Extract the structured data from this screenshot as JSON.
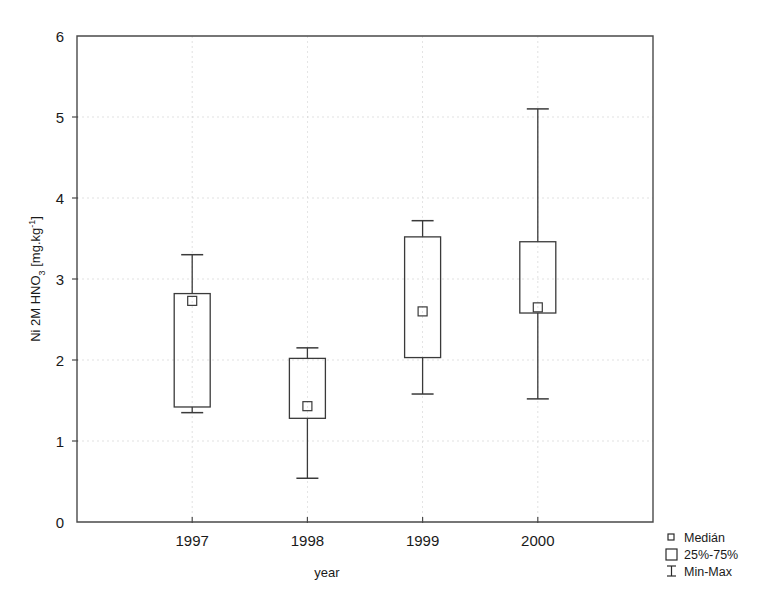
{
  "chart_data": {
    "type": "box",
    "title": "",
    "xlabel": "year",
    "ylabel": "Ni 2M HNO3 [mg.kg-1]",
    "ylabel_parts": {
      "prefix": "Ni 2M HNO",
      "sub": "3",
      "mid": " [mg.kg",
      "sup": "-1",
      "suffix": "]"
    },
    "categories": [
      "1997",
      "1998",
      "1999",
      "2000"
    ],
    "ylim": [
      0,
      6
    ],
    "yticks": [
      0,
      1,
      2,
      3,
      4,
      5,
      6
    ],
    "ytick_labels": [
      "0",
      "1",
      "2",
      "3",
      "4",
      "5",
      "6"
    ],
    "grid": true,
    "grid_style": "dotted",
    "legend_position": "bottom-right",
    "legend": [
      {
        "label": "Medián",
        "glyph": "small-square",
        "meaning": "median"
      },
      {
        "label": "25%-75%",
        "glyph": "large-square",
        "meaning": "interquartile-range"
      },
      {
        "label": "Min-Max",
        "glyph": "i-beam",
        "meaning": "range"
      }
    ],
    "boxes": [
      {
        "category": "1997",
        "min": 1.35,
        "q1": 1.42,
        "median": 2.73,
        "q3": 2.82,
        "max": 3.3
      },
      {
        "category": "1998",
        "min": 0.54,
        "q1": 1.28,
        "median": 1.43,
        "q3": 2.02,
        "max": 2.15
      },
      {
        "category": "1999",
        "min": 1.58,
        "q1": 2.03,
        "median": 2.6,
        "q3": 3.52,
        "max": 3.72
      },
      {
        "category": "2000",
        "min": 1.52,
        "q1": 2.58,
        "median": 2.65,
        "q3": 3.46,
        "max": 5.1
      }
    ],
    "colors": {
      "axis": "#4a4a4a",
      "box": "#3a3a3a",
      "grid": "#c9c9c9",
      "background": "#ffffff",
      "text": "#1a1a1a"
    }
  }
}
